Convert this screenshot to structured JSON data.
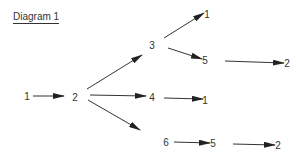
{
  "title": "Diagram 1",
  "colors": {
    "ink": "#333333",
    "background": "#ffffff"
  },
  "nodes": [
    {
      "id": "n1",
      "label": "1",
      "x": 27,
      "y": 96
    },
    {
      "id": "n2",
      "label": "2",
      "x": 75,
      "y": 97
    },
    {
      "id": "n3",
      "label": "3",
      "x": 152,
      "y": 45
    },
    {
      "id": "n3_1",
      "label": "1",
      "x": 207,
      "y": 14
    },
    {
      "id": "n3_5",
      "label": "5",
      "x": 205,
      "y": 60
    },
    {
      "id": "n3_5_2",
      "label": "2",
      "x": 287,
      "y": 63
    },
    {
      "id": "n4",
      "label": "4",
      "x": 152,
      "y": 97
    },
    {
      "id": "n4_1",
      "label": "1",
      "x": 205,
      "y": 100
    },
    {
      "id": "n6",
      "label": "6",
      "x": 166,
      "y": 142
    },
    {
      "id": "n6_5",
      "label": "5",
      "x": 213,
      "y": 143
    },
    {
      "id": "n6_5_2",
      "label": "2",
      "x": 278,
      "y": 145
    }
  ],
  "edges": [
    {
      "from": "n1",
      "to": "n2",
      "x1": 33,
      "y1": 96,
      "x2": 64,
      "y2": 96
    },
    {
      "from": "n2",
      "to": "n3",
      "x1": 87,
      "y1": 89,
      "x2": 142,
      "y2": 55
    },
    {
      "from": "n2",
      "to": "n4",
      "x1": 90,
      "y1": 95,
      "x2": 146,
      "y2": 96
    },
    {
      "from": "n2",
      "to": "n6",
      "x1": 88,
      "y1": 100,
      "x2": 140,
      "y2": 130
    },
    {
      "from": "n3",
      "to": "n3_1",
      "x1": 164,
      "y1": 38,
      "x2": 204,
      "y2": 13
    },
    {
      "from": "n3",
      "to": "n3_5",
      "x1": 168,
      "y1": 48,
      "x2": 202,
      "y2": 59
    },
    {
      "from": "n3_5",
      "to": "n3_5_2",
      "x1": 225,
      "y1": 61,
      "x2": 284,
      "y2": 63
    },
    {
      "from": "n4",
      "to": "n4_1",
      "x1": 164,
      "y1": 98,
      "x2": 203,
      "y2": 99
    },
    {
      "from": "n6",
      "to": "n6_5",
      "x1": 174,
      "y1": 142,
      "x2": 210,
      "y2": 143
    },
    {
      "from": "n6_5",
      "to": "n6_5_2",
      "x1": 233,
      "y1": 144,
      "x2": 275,
      "y2": 145
    }
  ]
}
